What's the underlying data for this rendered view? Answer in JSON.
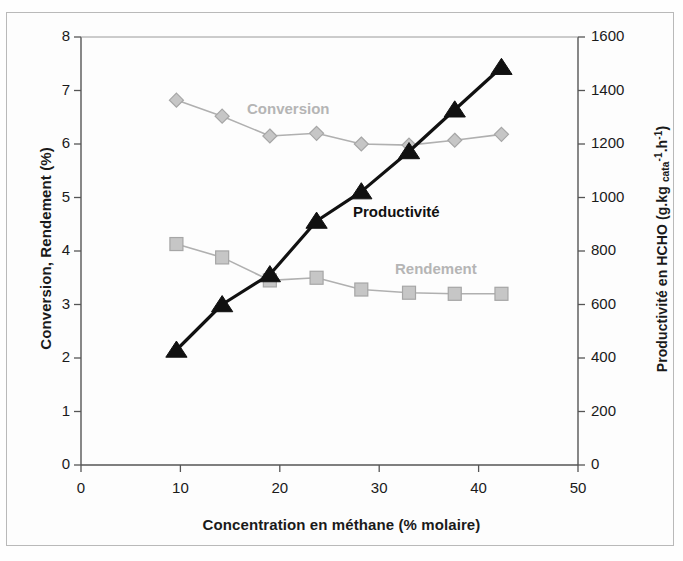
{
  "figure": {
    "background_color": "#fdfdfd",
    "frame_color": "#b9b9b9"
  },
  "axes": {
    "x": {
      "title": "Concentration en méthane (% molaire)",
      "ticks": [
        "0",
        "10",
        "20",
        "30",
        "40",
        "50"
      ],
      "min": 0,
      "max": 50
    },
    "y_left": {
      "title": "Conversion, Rendement (%)",
      "ticks": [
        "0",
        "1",
        "2",
        "3",
        "4",
        "5",
        "6",
        "7",
        "8"
      ],
      "min": 0,
      "max": 8
    },
    "y_right": {
      "title_parts": {
        "lead": "Productivité en HCHO (g.kg ",
        "sub": "cata",
        "sup1": "-1",
        "mid": ".h",
        "sup2": "-1",
        "tail": ")"
      },
      "title_plain": "Productivité en HCHO (g.kg cata-1.h-1)",
      "ticks": [
        "0",
        "200",
        "400",
        "600",
        "800",
        "1000",
        "1200",
        "1400",
        "1600"
      ],
      "min": 0,
      "max": 1600
    }
  },
  "series_labels": {
    "conversion": "Conversion",
    "rendement": "Rendement",
    "productivite": "Productivité"
  },
  "chart_data": {
    "type": "line",
    "title": "",
    "xlabel": "Concentration en méthane (% molaire)",
    "ylabel": "Conversion, Rendement (%)",
    "y2label": "Productivité en HCHO (g.kg cata-1.h-1)",
    "xlim": [
      0,
      50
    ],
    "ylim": [
      0,
      8
    ],
    "y2lim": [
      0,
      1600
    ],
    "xticks": [
      0,
      10,
      20,
      30,
      40,
      50
    ],
    "yticks": [
      0,
      1,
      2,
      3,
      4,
      5,
      6,
      7,
      8
    ],
    "y2ticks": [
      0,
      200,
      400,
      600,
      800,
      1000,
      1200,
      1400,
      1600
    ],
    "grid": false,
    "legend": "inline-annotations",
    "series": [
      {
        "name": "Conversion",
        "axis": "left",
        "marker": "diamond",
        "color": "#b0b0b0",
        "x": [
          9.6,
          14.2,
          19.0,
          23.7,
          28.2,
          33.0,
          37.6,
          42.3
        ],
        "values": [
          6.82,
          6.52,
          6.15,
          6.2,
          6.0,
          5.98,
          6.07,
          6.18
        ]
      },
      {
        "name": "Rendement",
        "axis": "left",
        "marker": "square",
        "color": "#b0b0b0",
        "x": [
          9.6,
          14.2,
          19.0,
          23.7,
          28.2,
          33.0,
          37.6,
          42.3
        ],
        "values": [
          4.13,
          3.88,
          3.45,
          3.5,
          3.28,
          3.22,
          3.2,
          3.2
        ]
      },
      {
        "name": "Productivité",
        "axis": "right",
        "marker": "triangle",
        "color": "#111111",
        "x": [
          9.6,
          14.2,
          19.0,
          23.7,
          28.2,
          33.0,
          37.6,
          42.3
        ],
        "values": [
          430,
          600,
          712,
          912,
          1022,
          1172,
          1328,
          1487
        ],
        "values_left_scale": [
          2.15,
          3.0,
          3.56,
          4.56,
          5.11,
          5.86,
          6.64,
          7.43
        ]
      }
    ]
  }
}
